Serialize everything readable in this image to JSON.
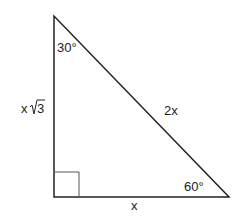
{
  "diagram": {
    "type": "right-triangle-30-60-90",
    "vertices": {
      "top": {
        "x": 54,
        "y": 16
      },
      "bottom_left": {
        "x": 54,
        "y": 197
      },
      "bottom_right": {
        "x": 229,
        "y": 197
      }
    },
    "angles": {
      "top": "30°",
      "bottom_right": "60°",
      "bottom_left": "right-angle"
    },
    "sides": {
      "vertical": {
        "coef": "x",
        "radical": "3"
      },
      "hypotenuse": "2x",
      "base": "x"
    },
    "colors": {
      "stroke": "#222222",
      "right_angle_marker": "#555555",
      "background": "#ffffff"
    }
  }
}
